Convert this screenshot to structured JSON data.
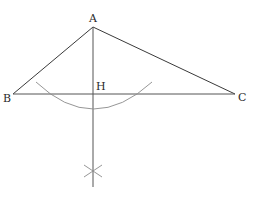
{
  "diagram": {
    "type": "geometric-construction",
    "points": {
      "A": {
        "label": "A",
        "x": 93,
        "y": 27
      },
      "B": {
        "label": "B",
        "x": 13,
        "y": 94
      },
      "C": {
        "label": "C",
        "x": 235,
        "y": 94
      },
      "H": {
        "label": "H",
        "x": 93,
        "y": 94
      }
    },
    "labels": {
      "A": "A",
      "B": "B",
      "C": "C",
      "H": "H"
    },
    "segments": [
      {
        "from": "A",
        "to": "B"
      },
      {
        "from": "A",
        "to": "C"
      },
      {
        "from": "B",
        "to": "C"
      }
    ],
    "perpendicular": {
      "from": "A",
      "foot": "H",
      "extends_to_y": 187
    },
    "colors": {
      "line": "#3a3a3a",
      "arc": "#8a8a8a",
      "label": "#2a2a2a"
    }
  }
}
